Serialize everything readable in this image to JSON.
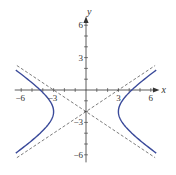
{
  "chart_data": {
    "type": "line",
    "title": "",
    "xlabel": "x",
    "ylabel": "y",
    "xlim": [
      -6.6,
      6.8
    ],
    "ylim": [
      -6.6,
      6.8
    ],
    "x_ticks": [
      -6,
      -5,
      -4,
      -3,
      -2,
      -1,
      1,
      2,
      3,
      4,
      5,
      6
    ],
    "y_ticks": [
      -6,
      -5,
      -4,
      -3,
      -2,
      -1,
      1,
      2,
      3,
      4,
      5,
      6
    ],
    "x_tick_labels": [
      {
        "value": -6,
        "label": "−6"
      },
      {
        "value": -3,
        "label": "−3"
      },
      {
        "value": 3,
        "label": "3"
      },
      {
        "value": 6,
        "label": "6"
      }
    ],
    "y_tick_labels": [
      {
        "value": 6,
        "label": "6"
      },
      {
        "value": 3,
        "label": "3"
      },
      {
        "value": -3,
        "label": "−3"
      },
      {
        "value": -6,
        "label": "−6"
      }
    ],
    "grid": false,
    "equation": "x^2/9 - (y+2)^2/4 = 1",
    "center": [
      0,
      -2
    ],
    "a": 3,
    "b": 2,
    "series": [
      {
        "name": "hyperbola",
        "style": "solid",
        "color": "#3a4a9a",
        "branches": [
          {
            "side": "left",
            "vertex": [
              -3,
              -2
            ]
          },
          {
            "side": "right",
            "vertex": [
              3,
              -2
            ]
          }
        ],
        "x_extent": 6.5
      },
      {
        "name": "asymptote-1",
        "style": "dashed",
        "color": "#444444",
        "equation": "y = (2/3)x - 2",
        "x_range": [
          -6.4,
          6.4
        ]
      },
      {
        "name": "asymptote-2",
        "style": "dashed",
        "color": "#444444",
        "equation": "y = -(2/3)x - 2",
        "x_range": [
          -6.4,
          6.4
        ]
      }
    ]
  },
  "colors": {
    "curve": "#3a4a9a",
    "asymptote": "#444444",
    "axis": "#333333"
  }
}
